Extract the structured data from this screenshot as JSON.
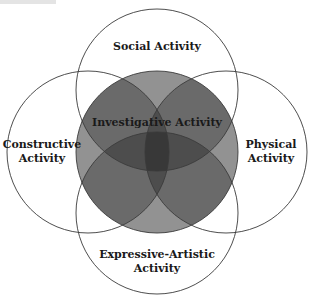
{
  "diagram": {
    "type": "venn",
    "colors": {
      "background": "#ffffff",
      "stroke": "#3a3a3a",
      "center_fill": "#c9c9c9",
      "overlap_fill": "rgba(0,0,0,0.27)",
      "text": "#1a1a1a"
    },
    "circles": [
      {
        "id": "social",
        "cx": 157,
        "cy": 90,
        "r": 81
      },
      {
        "id": "constructive",
        "cx": 88,
        "cy": 152,
        "r": 81
      },
      {
        "id": "physical",
        "cx": 226,
        "cy": 152,
        "r": 81
      },
      {
        "id": "expressive",
        "cx": 157,
        "cy": 213,
        "r": 81
      },
      {
        "id": "investigative",
        "cx": 157,
        "cy": 152,
        "r": 81
      }
    ],
    "labels": {
      "social": "Social Activity",
      "investigative": "Investigative Activity",
      "constructive_line1": "Constructive",
      "constructive_line2": "Activity",
      "physical_line1": "Physical",
      "physical_line2": "Activity",
      "expressive_line1": "Expressive-Artistic",
      "expressive_line2": "Activity"
    }
  }
}
